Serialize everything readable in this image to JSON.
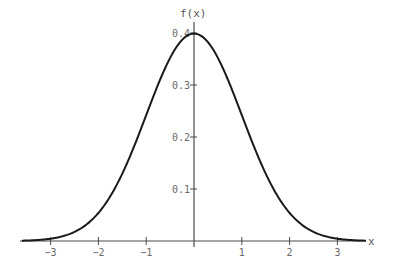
{
  "chart_data": {
    "type": "line",
    "title": "",
    "xlabel": "x",
    "ylabel": "f(x)",
    "xlim": [
      -3.6,
      3.6
    ],
    "ylim": [
      0,
      0.4
    ],
    "grid": false,
    "legend": null,
    "x_ticks": [
      -3,
      -2,
      -1,
      1,
      2,
      3
    ],
    "x_tick_labels": [
      "-3",
      "-2",
      "-1",
      "1",
      "2",
      "3"
    ],
    "y_ticks": [
      0.1,
      0.2,
      0.3,
      0.4
    ],
    "y_tick_labels": [
      "0.1",
      "0.2",
      "0.3",
      "0.4"
    ],
    "series": [
      {
        "name": "standard normal density",
        "function": "f(x) = exp(-x^2/2)/sqrt(2*pi)",
        "x": [
          -3.5,
          -3,
          -2.5,
          -2,
          -1.5,
          -1,
          -0.5,
          0,
          0.5,
          1,
          1.5,
          2,
          2.5,
          3,
          3.5
        ],
        "y": [
          0.0009,
          0.0044,
          0.0175,
          0.054,
          0.1295,
          0.242,
          0.3521,
          0.3989,
          0.3521,
          0.242,
          0.1295,
          0.054,
          0.0175,
          0.0044,
          0.0009
        ]
      }
    ]
  },
  "colors": {
    "curve": "#1a1a1a",
    "axis": "#4a4a55",
    "labels": "#6a6a6a"
  }
}
